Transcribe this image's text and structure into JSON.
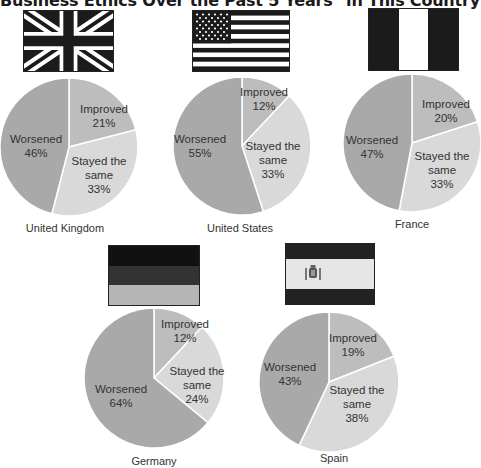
{
  "title": "Business Ethics Over the Past 5 Years\" in This Country",
  "colors": {
    "worsened": "#a9a9a9",
    "improved": "#bdbdbd",
    "same": "#d9d9d9",
    "divider": "#ffffff"
  },
  "chart_data": [
    {
      "type": "pie",
      "title": "United Kingdom",
      "categories": [
        "Improved",
        "Stayed the same",
        "Worsened"
      ],
      "values": [
        21,
        33,
        46
      ],
      "unit": "%"
    },
    {
      "type": "pie",
      "title": "United States",
      "categories": [
        "Improved",
        "Stayed the same",
        "Worsened"
      ],
      "values": [
        12,
        33,
        55
      ],
      "unit": "%"
    },
    {
      "type": "pie",
      "title": "France",
      "categories": [
        "Improved",
        "Stayed the same",
        "Worsened"
      ],
      "values": [
        20,
        33,
        47
      ],
      "unit": "%"
    },
    {
      "type": "pie",
      "title": "Germany",
      "categories": [
        "Improved",
        "Stayed the same",
        "Worsened"
      ],
      "values": [
        12,
        24,
        64
      ],
      "unit": "%"
    },
    {
      "type": "pie",
      "title": "Spain",
      "categories": [
        "Improved",
        "Stayed the same",
        "Worsened"
      ],
      "values": [
        19,
        38,
        43
      ],
      "unit": "%"
    }
  ],
  "pies": [
    {
      "country": "United Kingdom",
      "flag": "uk-flag",
      "improved": "Improved\n21%",
      "same": "Stayed the\nsame\n33%",
      "worsened": "Worsened\n46%"
    },
    {
      "country": "United States",
      "flag": "us-flag",
      "improved": "Improved\n12%",
      "same": "Stayed the\nsame\n33%",
      "worsened": "Worsened\n55%"
    },
    {
      "country": "France",
      "flag": "france-flag",
      "improved": "Improved\n20%",
      "same": "Stayed the\nsame\n33%",
      "worsened": "Worsened\n47%"
    },
    {
      "country": "Germany",
      "flag": "germany-flag",
      "improved": "Improved\n12%",
      "same": "Stayed the\nsame\n24%",
      "worsened": "Worsened\n64%"
    },
    {
      "country": "Spain",
      "flag": "spain-flag",
      "improved": "Improved\n19%",
      "same": "Stayed the\nsame\n38%",
      "worsened": "Worsened\n43%"
    }
  ]
}
